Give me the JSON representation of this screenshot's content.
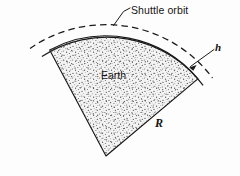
{
  "figure": {
    "kind": "physics-diagram",
    "background_color": "#fdfdfd",
    "line_color": "#1a1a1a",
    "fill_texture": "stipple-dots",
    "fill_base_color": "#f2f2f2",
    "stipple_dot_color": "#555555"
  },
  "labels": {
    "shuttle_orbit": "Shuttle orbit",
    "earth": "Earth",
    "altitude": "h",
    "radius": "R"
  },
  "annotations": {
    "shuttle_orbit_leader": "leader-line from text to dashed orbit arc",
    "altitude_arrow": "arrow from h label to gap between surface and orbit",
    "radius_marker": "R denotes Earth radius along sector edge"
  },
  "geometry": {
    "apex": {
      "x": 106,
      "y": 156
    },
    "surface_radius": 120,
    "orbit_radius": 133,
    "sector_start_angle_deg": -118,
    "sector_end_angle_deg": -40,
    "orbit_arc_style": "dashed",
    "surface_arc_style": "solid"
  }
}
